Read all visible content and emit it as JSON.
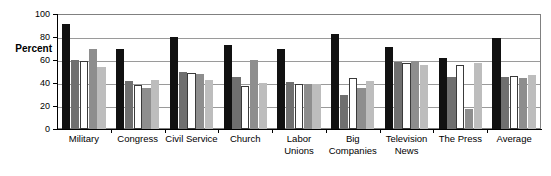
{
  "chart_data": {
    "type": "bar",
    "title": "",
    "subtitle": "",
    "xlabel": "",
    "ylabel": "Percent",
    "ylim": [
      0,
      100
    ],
    "yticks": [
      0,
      20,
      40,
      60,
      80,
      100
    ],
    "ytick_labels": [
      "0",
      "20",
      "40",
      "60",
      "80",
      "100"
    ],
    "grid": true,
    "grid_axis": "y",
    "legend": false,
    "legend_position": "none",
    "categories": [
      "Military",
      "Congress",
      "Civil Service",
      "Church",
      "Labor Unions",
      "Big Companies",
      "Television News",
      "The Press",
      "Average"
    ],
    "category_lines": [
      [
        "Military"
      ],
      [
        "Congress"
      ],
      [
        "Civil Service"
      ],
      [
        "Church"
      ],
      [
        "Labor",
        "Unions"
      ],
      [
        "Big",
        "Companies"
      ],
      [
        "Television",
        "News"
      ],
      [
        "The Press"
      ],
      [
        "Average"
      ]
    ],
    "series": [
      {
        "name": "Series 1",
        "color": "#111111",
        "values": [
          91,
          70,
          80,
          73,
          70,
          83,
          71,
          62,
          79
        ]
      },
      {
        "name": "Series 2",
        "color": "#6f6f6f",
        "values": [
          60,
          42,
          50,
          45,
          41,
          30,
          58,
          45,
          45
        ]
      },
      {
        "name": "Series 3",
        "color": "#ffffff",
        "values": [
          59,
          38,
          49,
          37,
          39,
          44,
          57,
          56,
          46
        ]
      },
      {
        "name": "Series 4",
        "color": "#8e8e8e",
        "values": [
          70,
          36,
          48,
          60,
          39,
          36,
          59,
          17,
          44
        ]
      },
      {
        "name": "Series 5",
        "color": "#bdbdbd",
        "values": [
          54,
          43,
          43,
          40,
          39,
          42,
          56,
          57,
          47
        ]
      }
    ]
  }
}
